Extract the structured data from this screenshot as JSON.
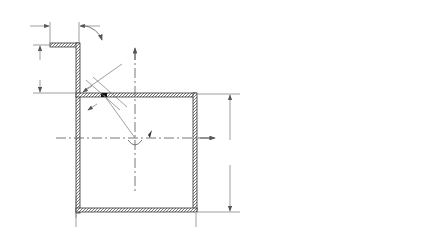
{
  "figure": {
    "left_panel": {
      "labels": {
        "Lw": "L",
        "Lw_sub": "w",
        "L1": "L",
        "L1_sub": "1",
        "T_top": "T",
        "ds": "ds",
        "X": "X",
        "r": "r",
        "qds": "qds",
        "Y": "Y",
        "b": "b",
        "T_center": "T",
        "t": "t",
        "h": "h"
      }
    },
    "right_panel": {
      "labels": {
        "ds": "ds",
        "gamma": "γ",
        "t": "t",
        "gamma_ds": "γds",
        "dz": "dz",
        "dQ": "dQ=qds"
      }
    }
  }
}
